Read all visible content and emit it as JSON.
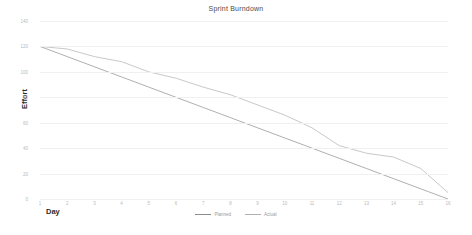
{
  "chart_data": {
    "type": "line",
    "title": "Sprint Burndown",
    "xlabel": "Day",
    "ylabel": "Effort",
    "x": [
      1,
      2,
      3,
      4,
      5,
      6,
      7,
      8,
      9,
      10,
      11,
      12,
      13,
      14,
      15,
      16
    ],
    "xlim": [
      1,
      16
    ],
    "ylim": [
      0,
      140
    ],
    "xticks": [
      "1",
      "2",
      "3",
      "4",
      "5",
      "6",
      "7",
      "8",
      "9",
      "10",
      "11",
      "12",
      "13",
      "14",
      "15",
      "16"
    ],
    "yticks": [
      "0",
      "20",
      "40",
      "60",
      "80",
      "100",
      "120",
      "140"
    ],
    "grid": "horizontal",
    "legend_position": "bottom-center",
    "series": [
      {
        "name": "Planned",
        "color": "#8c8c8c",
        "values": [
          120,
          112,
          104,
          96,
          88,
          80,
          72,
          64,
          56,
          48,
          40,
          32,
          24,
          16,
          8,
          0
        ]
      },
      {
        "name": "Actual",
        "color": "#b0b0b0",
        "values": [
          120,
          118,
          112,
          108,
          100,
          95,
          88,
          82,
          74,
          66,
          56,
          42,
          36,
          33,
          24,
          5
        ]
      }
    ]
  }
}
